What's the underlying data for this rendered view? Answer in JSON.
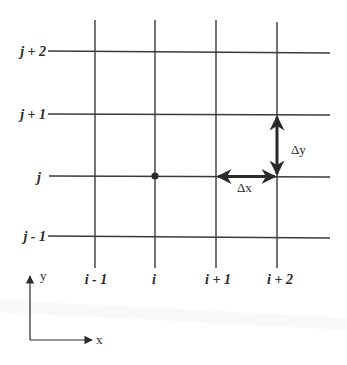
{
  "diagram": {
    "row_labels": [
      "j + 2",
      "j + 1",
      "j",
      "j - 1"
    ],
    "column_labels": [
      "i - 1",
      "i",
      "i + 1",
      "i + 2"
    ],
    "highlighted_node": {
      "column": "i",
      "row": "j"
    },
    "spacing": {
      "dx_label": "Δx",
      "dy_label": "Δy"
    },
    "axes": {
      "x_label": "x",
      "y_label": "y"
    },
    "colors": {
      "line": "#3a3a3a",
      "background": "#ffffff"
    }
  }
}
